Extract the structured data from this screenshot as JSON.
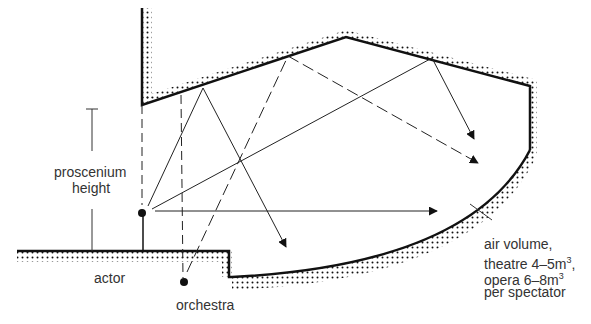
{
  "diagram": {
    "type": "section",
    "colors": {
      "line": "#111111",
      "text": "#333333",
      "background": "#ffffff"
    },
    "labels": {
      "proscenium_line1": "proscenium",
      "proscenium_line2": "height",
      "actor": "actor",
      "orchestra": "orchestra",
      "air_volume_line1": "air volume,",
      "air_volume_line2_pre": "theatre 4–5m",
      "air_volume_line2_sup": "3",
      "air_volume_line2_post": ",",
      "air_volume_line3_pre": "opera 6–8m",
      "air_volume_line3_sup": "3",
      "air_volume_line4": "per spectator"
    },
    "sources": [
      {
        "name": "actor",
        "x": 142,
        "y": 213
      },
      {
        "name": "orchestra",
        "x": 184,
        "y": 282
      }
    ],
    "elements": [
      "proscenium wall",
      "sloped ceiling",
      "rear wall",
      "raked floor",
      "stage floor",
      "sound rays"
    ]
  }
}
